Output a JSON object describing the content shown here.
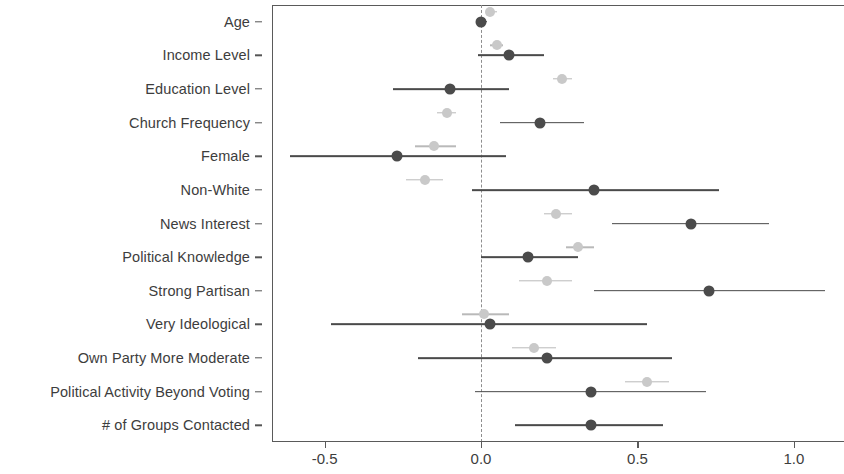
{
  "chart_data": {
    "type": "scatter",
    "title": "",
    "xlabel": "",
    "ylabel": "",
    "xlim": [
      -0.668,
      1.16
    ],
    "grid": false,
    "legend": "none",
    "reference_line": 0.0,
    "xticks": [
      -0.5,
      0.0,
      0.5,
      1.0
    ],
    "xticklabels": [
      "-0.5",
      "0.0",
      "0.5",
      "1.0"
    ],
    "categories": [
      "Age",
      "Income Level",
      "Education Level",
      "Church Frequency",
      "Female",
      "Non-White",
      "News Interest",
      "Political Knowledge",
      "Strong Partisan",
      "Very Ideological",
      "Own Party More Moderate",
      "Political Activity Beyond Voting",
      "# of Groups Contacted"
    ],
    "series": [
      {
        "name": "dark-estimates",
        "color": "#4b4b4b",
        "estimates": [
          0.0,
          0.09,
          -0.1,
          0.19,
          -0.27,
          0.36,
          0.67,
          0.15,
          0.73,
          0.03,
          0.21,
          0.35,
          0.35
        ],
        "ci_low": [
          -0.01,
          -0.01,
          -0.28,
          0.06,
          -0.61,
          -0.03,
          0.42,
          0.0,
          0.36,
          -0.48,
          -0.2,
          -0.02,
          0.11
        ],
        "ci_high": [
          0.02,
          0.2,
          0.09,
          0.33,
          0.08,
          0.76,
          0.92,
          0.31,
          1.1,
          0.53,
          0.61,
          0.72,
          0.58
        ]
      },
      {
        "name": "light-estimates",
        "color": "#c9c9c9",
        "estimates": [
          0.03,
          0.05,
          0.26,
          -0.11,
          -0.15,
          -0.18,
          0.24,
          0.31,
          0.21,
          0.01,
          0.17,
          0.53,
          null
        ],
        "ci_low": [
          0.02,
          0.03,
          0.23,
          -0.14,
          -0.21,
          -0.24,
          0.2,
          0.27,
          0.12,
          -0.06,
          0.1,
          0.46,
          null
        ],
        "ci_high": [
          0.05,
          0.07,
          0.29,
          -0.08,
          -0.08,
          -0.12,
          0.29,
          0.36,
          0.29,
          0.09,
          0.24,
          0.6,
          null
        ]
      }
    ]
  }
}
